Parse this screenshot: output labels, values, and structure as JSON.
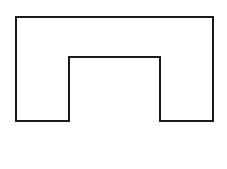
{
  "diagram": {
    "width": 227,
    "height": 169,
    "background": "#ffffff",
    "shape": {
      "type": "polygon",
      "description": "arch / inverted-U outline",
      "stroke": "#1a1a1a",
      "stroke_width": 2,
      "fill": "none",
      "points": "16,17 213,17 213,121 160,121 160,57 69,57 69,121 16,121"
    }
  }
}
